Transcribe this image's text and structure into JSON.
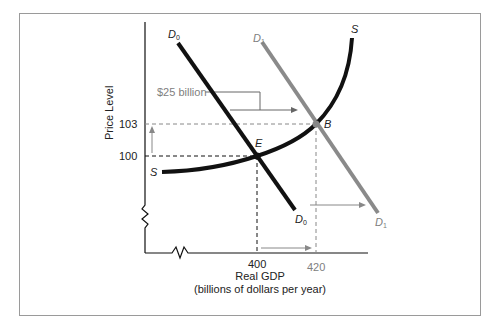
{
  "diagram": {
    "type": "aggregate demand and supply shift",
    "y_axis": {
      "label": "Price Level",
      "ticks": [
        "100",
        "103"
      ]
    },
    "x_axis": {
      "label": "Real GDP",
      "sublabel": "(billions of dollars per year)",
      "ticks": [
        "400",
        "420"
      ]
    },
    "curves": {
      "d0": {
        "label": "D",
        "sub": "0",
        "color": "#111111"
      },
      "d1": {
        "label": "D",
        "sub": "1",
        "color": "#8a8a8a"
      },
      "s": {
        "label": "S",
        "color": "#111111"
      }
    },
    "points": {
      "e": {
        "label": "E",
        "price": 100,
        "gdp": 400
      },
      "b": {
        "label": "B",
        "price": 103,
        "gdp": 420
      }
    },
    "annotation": "$25 billion"
  }
}
